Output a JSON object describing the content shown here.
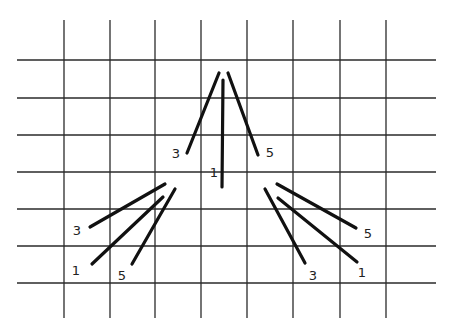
{
  "diagram": {
    "colors": {
      "background": "#ffffff",
      "grid": "#2a2a2a",
      "stroke": "#111111",
      "label": "#222222"
    },
    "grid": {
      "horizontal_lines_y": [
        60,
        98,
        135,
        172,
        209,
        246,
        283
      ],
      "horizontal_x_range": [
        17,
        436
      ],
      "vertical_lines_x": [
        64,
        110,
        155,
        201,
        247,
        293,
        340,
        386
      ],
      "vertical_y_range": [
        20,
        318
      ]
    },
    "clusters": [
      {
        "name": "top",
        "strokes": [
          {
            "label": "3",
            "x1": 219,
            "y1": 73,
            "x2": 187,
            "y2": 153,
            "label_x": 176,
            "label_y": 153
          },
          {
            "label": "1",
            "x1": 223,
            "y1": 80,
            "x2": 222,
            "y2": 187,
            "label_x": 214,
            "label_y": 172
          },
          {
            "label": "5",
            "x1": 228,
            "y1": 73,
            "x2": 258,
            "y2": 155,
            "label_x": 270,
            "label_y": 152
          }
        ]
      },
      {
        "name": "left",
        "strokes": [
          {
            "label": "3",
            "x1": 165,
            "y1": 184,
            "x2": 90,
            "y2": 227,
            "label_x": 77,
            "label_y": 230
          },
          {
            "label": "1",
            "x1": 163,
            "y1": 197,
            "x2": 92,
            "y2": 264,
            "label_x": 76,
            "label_y": 270
          },
          {
            "label": "5",
            "x1": 175,
            "y1": 189,
            "x2": 132,
            "y2": 264,
            "label_x": 122,
            "label_y": 275
          }
        ]
      },
      {
        "name": "right",
        "strokes": [
          {
            "label": "3",
            "x1": 265,
            "y1": 189,
            "x2": 305,
            "y2": 263,
            "label_x": 313,
            "label_y": 275
          },
          {
            "label": "1",
            "x1": 278,
            "y1": 198,
            "x2": 357,
            "y2": 262,
            "label_x": 362,
            "label_y": 272
          },
          {
            "label": "5",
            "x1": 277,
            "y1": 184,
            "x2": 356,
            "y2": 228,
            "label_x": 368,
            "label_y": 233
          }
        ]
      }
    ]
  }
}
